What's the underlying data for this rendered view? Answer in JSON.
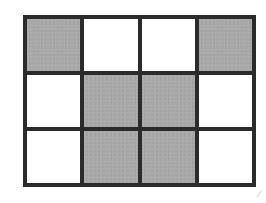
{
  "diagram": {
    "type": "grid",
    "rows": 3,
    "columns": 4,
    "colors": {
      "line": "#2b2b2b",
      "shaded": "#a9a9a9",
      "empty": "#ffffff"
    },
    "cells": [
      [
        "shaded",
        "empty",
        "empty",
        "shaded"
      ],
      [
        "empty",
        "shaded",
        "shaded",
        "empty"
      ],
      [
        "empty",
        "shaded",
        "shaded",
        "empty"
      ]
    ]
  }
}
